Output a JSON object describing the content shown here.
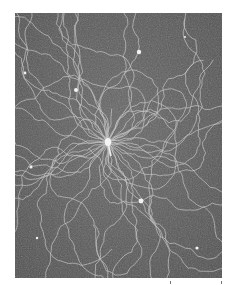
{
  "image": {
    "subject": "Electron micrograph of bacteriophage with DNA strands released from the head",
    "background_color": "#ffffff",
    "film_tone": "#5a5a5a",
    "strand_color": "#d8d8d8",
    "phage": {
      "head_center": [
        93,
        129
      ],
      "tail_end": [
        96,
        143
      ]
    },
    "particles": [
      {
        "x": 124,
        "y": 39,
        "r": 2.2
      },
      {
        "x": 61,
        "y": 77,
        "r": 2.0
      },
      {
        "x": 10,
        "y": 60,
        "r": 1.4
      },
      {
        "x": 16,
        "y": 154,
        "r": 1.6
      },
      {
        "x": 126,
        "y": 188,
        "r": 2.4
      },
      {
        "x": 182,
        "y": 235,
        "r": 1.6
      },
      {
        "x": 22,
        "y": 225,
        "r": 1.2
      },
      {
        "x": 170,
        "y": 24,
        "r": 1.0
      }
    ],
    "tick_marks": [
      170,
      222
    ]
  }
}
